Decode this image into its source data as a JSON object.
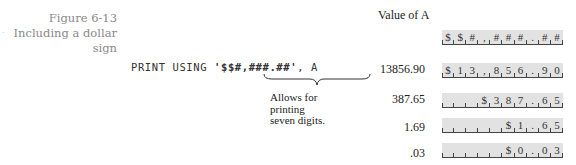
{
  "figure": {
    "number": "Figure 6-13",
    "title": "Including a dollar sign"
  },
  "statement": {
    "prefix": "PRINT USING ",
    "format": "'$$#,###.##'",
    "suffix": ", A"
  },
  "annotation": {
    "lines": [
      "Allows for",
      "printing",
      "seven digits."
    ]
  },
  "column_header": "Value of A",
  "format_mask": {
    "cells": [
      "$",
      "$",
      "#",
      ",",
      "#",
      "#",
      "#",
      ".",
      "#",
      "#"
    ]
  },
  "rows": [
    {
      "value": "13856.90",
      "cells": [
        "$",
        "1",
        "3",
        ",",
        "8",
        "5",
        "6",
        ".",
        "9",
        "0"
      ]
    },
    {
      "value": "387.65",
      "cells": [
        "",
        "",
        "",
        "$",
        "3",
        "8",
        "7",
        ".",
        "6",
        "5"
      ]
    },
    {
      "value": "1.69",
      "cells": [
        "",
        "",
        "",
        "",
        "",
        "$",
        "1",
        ".",
        "6",
        "5"
      ]
    },
    {
      "value": ".03",
      "cells": [
        "",
        "",
        "",
        "",
        "",
        "$",
        "0",
        ".",
        "0",
        "3"
      ]
    }
  ]
}
